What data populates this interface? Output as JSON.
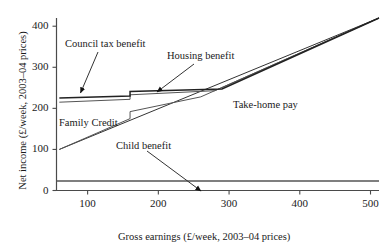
{
  "chart_data": {
    "type": "line",
    "title": "",
    "xlabel": "Gross earnings (£/week, 2003–04 prices)",
    "ylabel": "Net income (£/week, 2003–04 prices)",
    "xlim": [
      56,
      512
    ],
    "ylim": [
      0,
      420
    ],
    "xticks": [
      100,
      200,
      300,
      400,
      500
    ],
    "yticks": [
      0,
      100,
      200,
      300,
      400
    ],
    "xtick_labels": [
      "100",
      "200",
      "300",
      "400",
      "500"
    ],
    "ytick_labels": [
      "0",
      "100",
      "200",
      "300",
      "400"
    ],
    "grid": false,
    "legend_position": "none",
    "annotations": [
      {
        "text": "Council tax benefit",
        "points_to_x": 112,
        "points_to_y": 238
      },
      {
        "text": "Housing benefit",
        "points_to_x": 244,
        "points_to_y": 242
      },
      {
        "text": "Family Credit",
        "points_to_x": 120,
        "points_to_y": 196
      },
      {
        "text": "Take-home pay",
        "points_to_x": 320,
        "points_to_y": 228
      },
      {
        "text": "Child benefit",
        "points_to_x": 200,
        "points_to_y": 23
      }
    ],
    "series": [
      {
        "name": "Child benefit",
        "color": "#555555",
        "points": [
          [
            56,
            23
          ],
          [
            512,
            23
          ]
        ]
      },
      {
        "name": "Take-home pay",
        "color": "#333333",
        "points": [
          [
            60,
            100
          ],
          [
            512,
            420
          ]
        ]
      },
      {
        "name": "Family Credit",
        "color": "#555555",
        "points": [
          [
            60,
            100
          ],
          [
            160,
            175
          ],
          [
            160,
            192
          ],
          [
            260,
            228
          ],
          [
            512,
            420
          ]
        ]
      },
      {
        "name": "Housing benefit",
        "color": "#555555",
        "points": [
          [
            60,
            215
          ],
          [
            160,
            222
          ],
          [
            160,
            233
          ],
          [
            280,
            243
          ],
          [
            512,
            420
          ]
        ]
      },
      {
        "name": "Council tax benefit",
        "color": "#222222",
        "points": [
          [
            60,
            225
          ],
          [
            160,
            230
          ],
          [
            160,
            241
          ],
          [
            290,
            247
          ],
          [
            512,
            420
          ]
        ]
      }
    ]
  },
  "axis": {
    "xlabel": "Gross earnings (£/week, 2003–04 prices)",
    "ylabel": "Net income (£/week, 2003–04 prices)"
  },
  "ticks": {
    "x": [
      "100",
      "200",
      "300",
      "400",
      "500"
    ],
    "y": [
      "0",
      "100",
      "200",
      "300",
      "400"
    ]
  },
  "labels": {
    "council_tax_benefit": "Council tax benefit",
    "housing_benefit": "Housing benefit",
    "family_credit": "Family Credit",
    "take_home_pay": "Take-home pay",
    "child_benefit": "Child benefit"
  },
  "colors": {
    "axis": "#4a4a4a",
    "line_dark": "#222222",
    "line_mid": "#555555",
    "text": "#1a1a1a"
  }
}
